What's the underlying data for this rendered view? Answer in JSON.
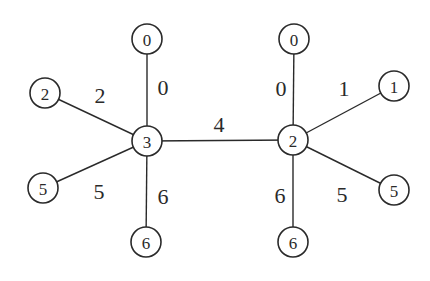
{
  "diagram": {
    "type": "graph",
    "nodes": [
      {
        "id": "L_center",
        "label": "3",
        "x": 147,
        "y": 141,
        "r": 15
      },
      {
        "id": "R_center",
        "label": "2",
        "x": 293,
        "y": 140,
        "r": 15
      },
      {
        "id": "L_top",
        "label": "0",
        "x": 147,
        "y": 39,
        "r": 15
      },
      {
        "id": "L_left",
        "label": "2",
        "x": 45,
        "y": 93,
        "r": 15
      },
      {
        "id": "L_lowleft",
        "label": "5",
        "x": 43,
        "y": 188,
        "r": 15
      },
      {
        "id": "L_bottom",
        "label": "6",
        "x": 146,
        "y": 242,
        "r": 15
      },
      {
        "id": "R_top",
        "label": "0",
        "x": 294,
        "y": 39,
        "r": 15
      },
      {
        "id": "R_right",
        "label": "1",
        "x": 394,
        "y": 86,
        "r": 15
      },
      {
        "id": "R_lowright",
        "label": "5",
        "x": 394,
        "y": 190,
        "r": 15
      },
      {
        "id": "R_bottom",
        "label": "6",
        "x": 293,
        "y": 242,
        "r": 15
      }
    ],
    "edges": [
      {
        "from": "L_center",
        "to": "R_center",
        "label": "4",
        "lx": 219,
        "ly": 124
      },
      {
        "from": "L_center",
        "to": "L_top",
        "label": "0",
        "lx": 163,
        "ly": 87
      },
      {
        "from": "L_center",
        "to": "L_left",
        "label": "2",
        "lx": 100,
        "ly": 95
      },
      {
        "from": "L_center",
        "to": "L_lowleft",
        "label": "5",
        "lx": 99,
        "ly": 191
      },
      {
        "from": "L_center",
        "to": "L_bottom",
        "label": "6",
        "lx": 163,
        "ly": 196
      },
      {
        "from": "R_center",
        "to": "R_top",
        "label": "0",
        "lx": 281,
        "ly": 88
      },
      {
        "from": "R_center",
        "to": "R_right",
        "label": "1",
        "lx": 344,
        "ly": 88
      },
      {
        "from": "R_center",
        "to": "R_lowright",
        "label": "5",
        "lx": 342,
        "ly": 194
      },
      {
        "from": "R_center",
        "to": "R_bottom",
        "label": "6",
        "lx": 280,
        "ly": 195
      }
    ]
  }
}
